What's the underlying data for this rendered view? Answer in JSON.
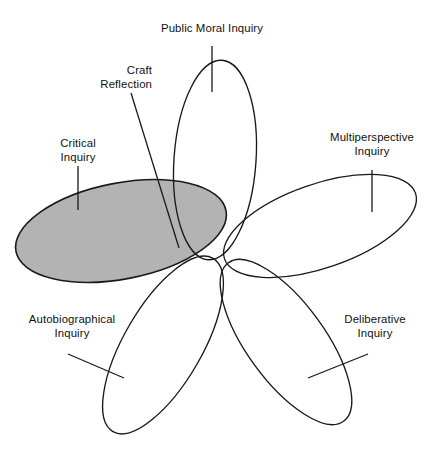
{
  "diagram": {
    "title_text": "Public Moral Inquiry",
    "convergence_point": {
      "x": 225,
      "y": 262
    },
    "canvas": {
      "width": 438,
      "height": 458
    },
    "stroke_color": "#1a1a1a",
    "background_color": "#ffffff",
    "highlight_fill_color": "#b3b3b3",
    "labels": {
      "public_moral_inquiry": "Public Moral Inquiry",
      "craft_reflection": "Craft\nReflection",
      "critical_inquiry": "Critical\nInquiry",
      "multiperspective_inquiry": "Multiperspective\nInquiry",
      "autobiographical_inquiry": "Autobiographical\nInquiry",
      "deliberative_inquiry": "Deliberative\nInquiry"
    },
    "petals": [
      {
        "name": "public-moral-inquiry",
        "label": "Public Moral Inquiry",
        "filled": false,
        "fill_color": "none",
        "angle_deg": -88,
        "rx": 104,
        "ry": 41
      },
      {
        "name": "multiperspective-inquiry",
        "label": "Multiperspective Inquiry",
        "filled": false,
        "fill_color": "none",
        "angle_deg": -20,
        "rx": 101,
        "ry": 42
      },
      {
        "name": "deliberative-inquiry",
        "label": "Deliberative Inquiry",
        "filled": false,
        "fill_color": "none",
        "angle_deg": 53,
        "rx": 101,
        "ry": 39
      },
      {
        "name": "autobiographical-inquiry",
        "label": "Autobiographical Inquiry",
        "filled": false,
        "fill_color": "none",
        "angle_deg": 122,
        "rx": 101,
        "ry": 39
      },
      {
        "name": "critical-inquiry",
        "label": "Critical Inquiry",
        "filled": true,
        "fill_color": "#b3b3b3",
        "angle_deg": 197,
        "rx": 107,
        "ry": 48
      }
    ],
    "annotation": {
      "name": "craft-reflection",
      "label": "Craft Reflection",
      "target_region": "overlap of Critical Inquiry and Public Moral Inquiry"
    }
  }
}
